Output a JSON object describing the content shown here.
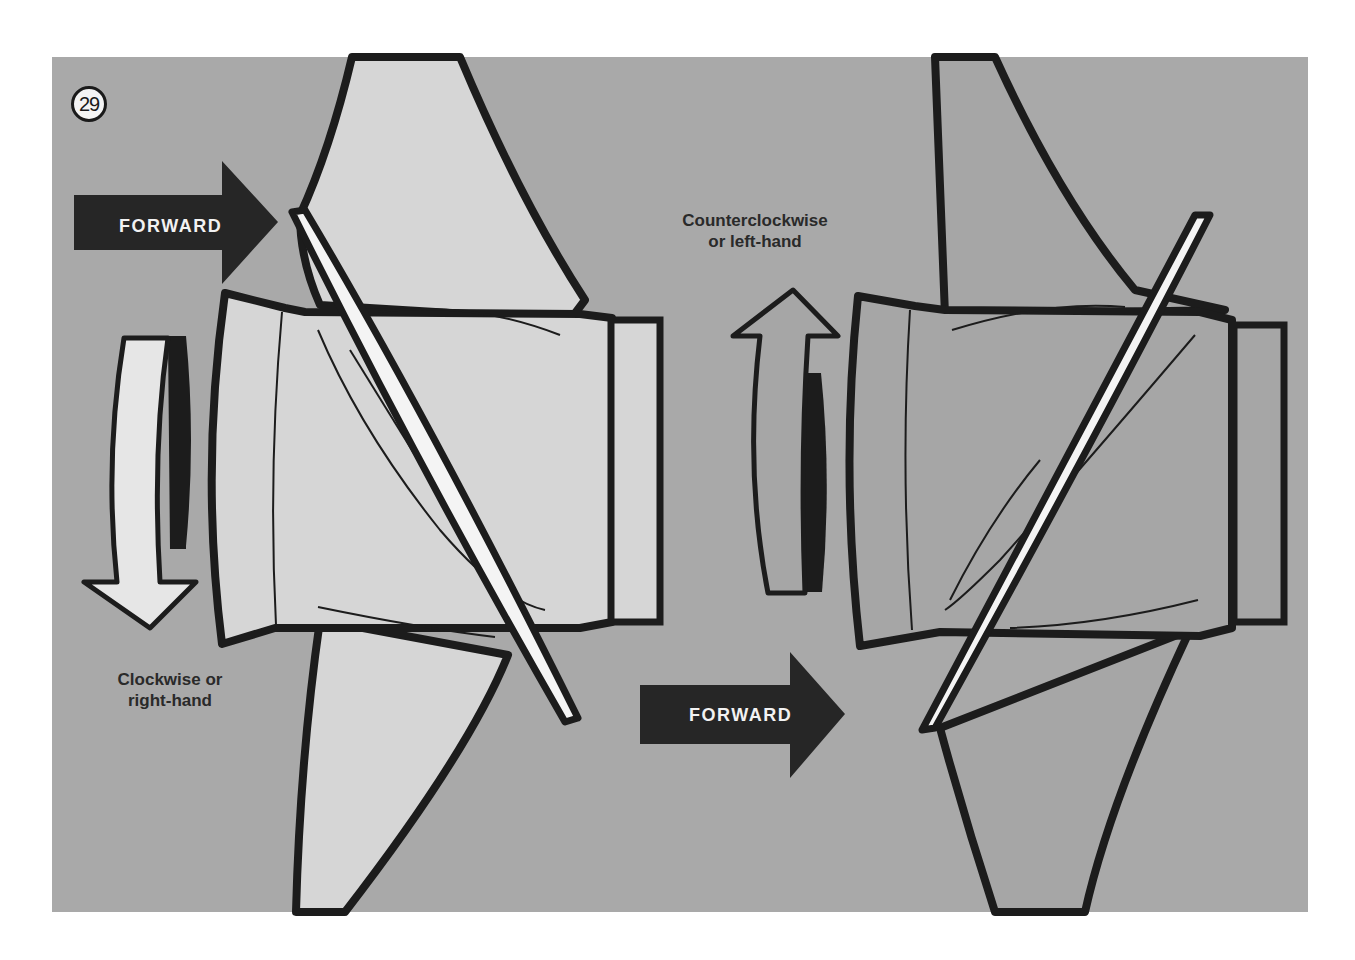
{
  "figure": {
    "number": "29",
    "colors": {
      "background": "#a9a9a9",
      "page": "#ffffff",
      "left_propeller_fill": "#d6d6d6",
      "right_propeller_fill": "#a6a6a6",
      "outline": "#1c1c1c",
      "blade_edge_highlight": "#f4f4f4",
      "forward_arrow": "#262626"
    },
    "left_propeller": {
      "rotation_label_line1": "Clockwise or",
      "rotation_label_line2": "right-hand",
      "forward_label": "FORWARD",
      "rotation_arrow_direction": "down"
    },
    "right_propeller": {
      "rotation_label_line1": "Counterclockwise",
      "rotation_label_line2": "or left-hand",
      "forward_label": "FORWARD",
      "rotation_arrow_direction": "up"
    }
  }
}
